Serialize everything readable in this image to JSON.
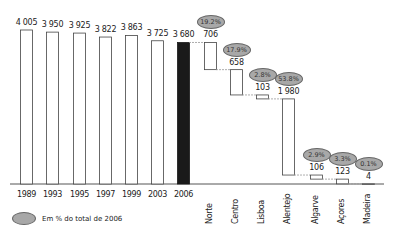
{
  "chart_data": {
    "type": "bar",
    "subtype": "waterfall",
    "title": "",
    "xlabel": "",
    "ylabel": "",
    "grid": false,
    "legend_position": "bottom-left",
    "years": {
      "categories": [
        "1989",
        "1993",
        "1995",
        "1997",
        "1999",
        "2003",
        "2006"
      ],
      "values": [
        4005,
        3950,
        3925,
        3822,
        3863,
        3725,
        3680
      ],
      "value_labels": [
        "4 005",
        "3 950",
        "3 925",
        "3 822",
        "3 863",
        "3 725",
        "3 680"
      ],
      "highlight": "2006"
    },
    "regions_2006": {
      "categories": [
        "Norte",
        "Centro",
        "Lisboa",
        "Alentejo",
        "Algarve",
        "Açores",
        "Madeira"
      ],
      "values": [
        706,
        658,
        103,
        1980,
        106,
        123,
        4
      ],
      "value_labels": [
        "706",
        "658",
        "103",
        "1 980",
        "106",
        "123",
        "4"
      ],
      "percent_of_2006": [
        "19.2%",
        "17.9%",
        "2.8%",
        "53.8%",
        "2.9%",
        "3.3%",
        "0.1%"
      ]
    },
    "legend": [
      {
        "symbol": "grey-ellipse",
        "label": "Em % do total de 2006"
      }
    ],
    "colors": {
      "bar_fill": "#ffffff",
      "bar_stroke": "#444444",
      "highlight_fill": "#1a1a1a",
      "pct_bubble": "#a8a8a8",
      "connector": "#999999"
    }
  },
  "legend": {
    "label": "Em % do total de 2006"
  }
}
